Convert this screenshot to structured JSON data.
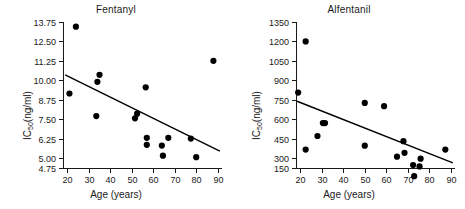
{
  "figure": {
    "background": "#ffffff",
    "point_color": "#000000",
    "line_color": "#000000",
    "axis_color": "#1a1a1a"
  },
  "chart_data": [
    {
      "type": "scatter",
      "title": "Fentanyl",
      "xlabel": "Age (years)",
      "ylabel": "IC50(ng/ml)",
      "ylabel_base": "IC",
      "ylabel_sub": "50",
      "ylabel_rest": "(ng/ml)",
      "xlim": [
        18,
        92
      ],
      "ylim": [
        4.75,
        13.75
      ],
      "xticks": [
        20,
        30,
        40,
        50,
        60,
        70,
        80,
        90
      ],
      "yticks": [
        4.75,
        5.0,
        6.25,
        7.5,
        8.75,
        10.0,
        11.25,
        12.5,
        13.75
      ],
      "ytick_labels": [
        "4.75",
        "5.00",
        "6.25",
        "7.50",
        "8.75",
        "10.00",
        "11.25",
        "12.50",
        "13.75"
      ],
      "grid": false,
      "legend": "none",
      "points": [
        {
          "x": 21,
          "y": 9.15
        },
        {
          "x": 24,
          "y": 13.45
        },
        {
          "x": 33.5,
          "y": 7.7
        },
        {
          "x": 34,
          "y": 9.9
        },
        {
          "x": 35,
          "y": 10.35
        },
        {
          "x": 51.5,
          "y": 7.55
        },
        {
          "x": 52.5,
          "y": 7.85
        },
        {
          "x": 56.5,
          "y": 9.55
        },
        {
          "x": 57,
          "y": 6.3
        },
        {
          "x": 57,
          "y": 5.85
        },
        {
          "x": 64,
          "y": 5.8
        },
        {
          "x": 64.5,
          "y": 5.15
        },
        {
          "x": 67,
          "y": 6.3
        },
        {
          "x": 77.5,
          "y": 6.25
        },
        {
          "x": 80,
          "y": 5.05
        },
        {
          "x": 88,
          "y": 11.25
        }
      ],
      "regression": {
        "x_start": 19,
        "y_start": 10.35,
        "x_end": 91,
        "y_end": 5.45
      }
    },
    {
      "type": "scatter",
      "title": "Alfentanil",
      "xlabel": "Age (years)",
      "ylabel": "IC50(ng/ml)",
      "ylabel_base": "IC",
      "ylabel_sub": "50",
      "ylabel_rest": "(ng/ml)",
      "xlim": [
        18,
        92
      ],
      "ylim": [
        150,
        1350
      ],
      "xticks": [
        20,
        30,
        40,
        50,
        60,
        70,
        80,
        90
      ],
      "yticks": [
        150,
        300,
        450,
        600,
        750,
        900,
        1050,
        1200,
        1350
      ],
      "ytick_labels": [
        "150",
        "300",
        "450",
        "600",
        "750",
        "900",
        "1050",
        "1200",
        "1350"
      ],
      "grid": false,
      "legend": "none",
      "points": [
        {
          "x": 19,
          "y": 805
        },
        {
          "x": 22.5,
          "y": 1200
        },
        {
          "x": 22.5,
          "y": 365
        },
        {
          "x": 28,
          "y": 470
        },
        {
          "x": 30.5,
          "y": 570
        },
        {
          "x": 31.5,
          "y": 570
        },
        {
          "x": 50,
          "y": 725
        },
        {
          "x": 50,
          "y": 395
        },
        {
          "x": 59,
          "y": 700
        },
        {
          "x": 65,
          "y": 310
        },
        {
          "x": 68,
          "y": 430
        },
        {
          "x": 68.5,
          "y": 340
        },
        {
          "x": 72.5,
          "y": 245
        },
        {
          "x": 73,
          "y": 160
        },
        {
          "x": 75.5,
          "y": 235
        },
        {
          "x": 76,
          "y": 295
        },
        {
          "x": 87.5,
          "y": 365
        }
      ],
      "regression": {
        "x_start": 18.5,
        "y_start": 738,
        "x_end": 91,
        "y_end": 262
      }
    }
  ]
}
